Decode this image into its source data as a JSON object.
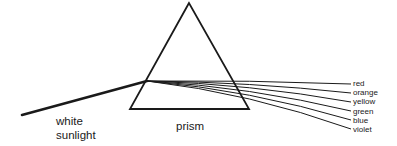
{
  "diagram": {
    "labels": {
      "white_light": [
        "white",
        "sunlight"
      ],
      "prism": "prism"
    },
    "spectrum": [
      "red",
      "orange",
      "yellow",
      "green",
      "blue",
      "violet"
    ],
    "colors": {
      "stroke": "#1a1a1a",
      "background": "#ffffff"
    }
  }
}
